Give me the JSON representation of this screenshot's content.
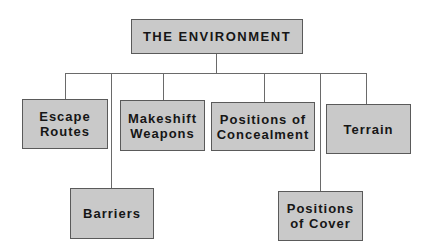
{
  "root": {
    "label": "THE ENVIRONMENT"
  },
  "children": [
    {
      "id": "escape-routes",
      "label_lines": [
        "Escape",
        "Routes"
      ]
    },
    {
      "id": "barriers",
      "label_lines": [
        "Barriers"
      ]
    },
    {
      "id": "makeshift-weapons",
      "label_lines": [
        "Makeshift",
        "Weapons"
      ]
    },
    {
      "id": "positions-of-concealment",
      "label_lines": [
        "Positions of",
        "Concealment"
      ]
    },
    {
      "id": "positions-of-cover",
      "label_lines": [
        "Positions",
        "of Cover"
      ]
    },
    {
      "id": "terrain",
      "label_lines": [
        "Terrain"
      ]
    }
  ],
  "colors": {
    "box_fill": "#c9c9c9",
    "box_border": "#5a5a5a",
    "line": "#6a6a6a",
    "text": "#161616"
  }
}
